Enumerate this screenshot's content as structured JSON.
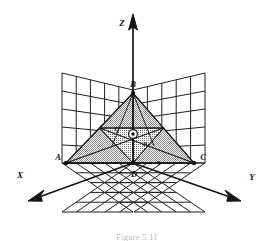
{
  "figure": {
    "type": "geometry-diagram-3d",
    "background_color": "#ffffff",
    "line_color": "#141414",
    "shade_color": "#b0b0b0",
    "axes": [
      {
        "name": "x-axis",
        "label": "X",
        "direction": "front-left-down"
      },
      {
        "name": "y-axis",
        "label": "Y",
        "direction": "front-right-down"
      },
      {
        "name": "z-axis",
        "label": "Z",
        "direction": "up"
      }
    ],
    "vertex_labels": [
      {
        "name": "vertex-A",
        "label": "A",
        "x": 62,
        "y": 159
      },
      {
        "name": "vertex-B",
        "label": "B",
        "x": 133,
        "y": 90
      },
      {
        "name": "vertex-C",
        "label": "C",
        "x": 198,
        "y": 160
      },
      {
        "name": "vertex-D",
        "label": "D",
        "x": 140,
        "y": 180
      }
    ],
    "interior_labels": [
      {
        "name": "point-Q",
        "label": "Q",
        "x": 116,
        "y": 136
      },
      {
        "name": "point-O",
        "label": "O",
        "x": 133,
        "y": 138
      },
      {
        "name": "point-P",
        "label": "P",
        "x": 145,
        "y": 148
      }
    ],
    "grid": {
      "divisions": 5,
      "planes": [
        "xz-left-wall",
        "yz-right-wall",
        "xy-floor"
      ]
    },
    "caption": "Figure 5.11"
  }
}
